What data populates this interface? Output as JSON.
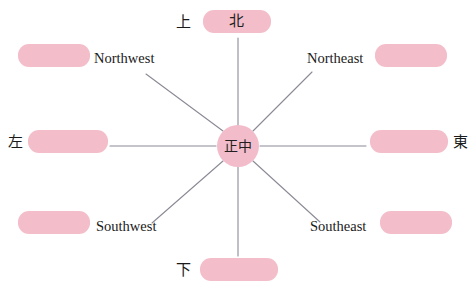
{
  "diagram": {
    "type": "eight-direction-compass",
    "center": {
      "text": "正中",
      "name": "center-node"
    },
    "accent_color": "#f3bdca",
    "line_color": "#8a8a96",
    "background_color": "#ffffff",
    "pills": [
      {
        "id": "north",
        "text": "北",
        "position": "top"
      },
      {
        "id": "south",
        "text": "",
        "position": "bottom"
      },
      {
        "id": "west",
        "text": "",
        "position": "left"
      },
      {
        "id": "east",
        "text": "",
        "position": "right"
      },
      {
        "id": "northwest",
        "text": "",
        "position": "top-left"
      },
      {
        "id": "northeast",
        "text": "",
        "position": "top-right"
      },
      {
        "id": "southwest",
        "text": "",
        "position": "bottom-left"
      },
      {
        "id": "southeast",
        "text": "",
        "position": "bottom-right"
      }
    ],
    "labels": {
      "shang": "上",
      "xia": "下",
      "zuo": "左",
      "dong": "東",
      "northwest": "Northwest",
      "northeast": "Northeast",
      "southwest": "Southwest",
      "southeast": "Southeast"
    },
    "spokes": [
      {
        "id": "spoke-north",
        "x1": 238,
        "y1": 126,
        "x2": 238,
        "y2": 38
      },
      {
        "id": "spoke-south",
        "x1": 238,
        "y1": 166,
        "x2": 238,
        "y2": 256
      },
      {
        "id": "spoke-west",
        "x1": 216,
        "y1": 146,
        "x2": 110,
        "y2": 146
      },
      {
        "id": "spoke-east",
        "x1": 260,
        "y1": 146,
        "x2": 366,
        "y2": 146
      },
      {
        "id": "spoke-northwest",
        "x1": 223,
        "y1": 131,
        "x2": 146,
        "y2": 74
      },
      {
        "id": "spoke-northeast",
        "x1": 253,
        "y1": 131,
        "x2": 312,
        "y2": 72
      },
      {
        "id": "spoke-southwest",
        "x1": 223,
        "y1": 161,
        "x2": 152,
        "y2": 223
      },
      {
        "id": "spoke-southeast",
        "x1": 253,
        "y1": 161,
        "x2": 320,
        "y2": 222
      }
    ]
  }
}
